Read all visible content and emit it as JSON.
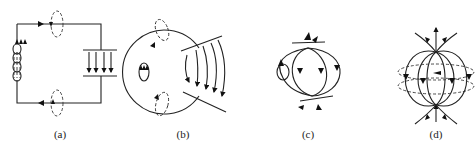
{
  "figure": {
    "panels": [
      {
        "id": "a",
        "label": "(a)",
        "description": "LC circuit: inductor coil at left, parallel-plate capacitor at right with downward field arrows, dashed magnetic loops around top and bottom wires"
      },
      {
        "id": "b",
        "label": "(b)",
        "description": "Circuit bent into circle, capacitor plates opened outward, curved field lines"
      },
      {
        "id": "c",
        "label": "(c)",
        "description": "Plates folded further, field lines forming closed lobes between two points"
      },
      {
        "id": "d",
        "label": "(d)",
        "description": "Oscillating electric dipole: field lines from top to bottom with dashed magnetic loops"
      }
    ]
  }
}
